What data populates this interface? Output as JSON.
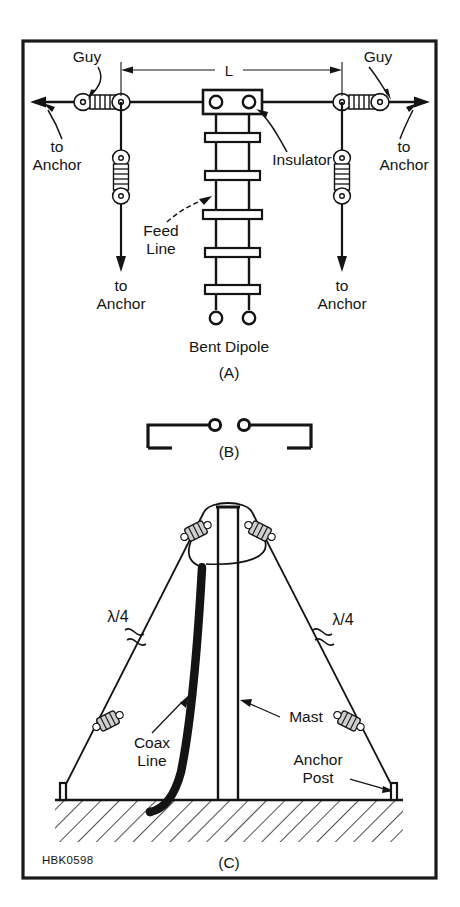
{
  "figure": {
    "id_code": "HBK0598",
    "panels": [
      {
        "key": "A",
        "caption": "Bent Dipole",
        "label": "(A)"
      },
      {
        "key": "B",
        "caption": "",
        "label": "(B)"
      },
      {
        "key": "C",
        "caption": "",
        "label": "(C)"
      }
    ],
    "panel_a": {
      "dimension_label": "L",
      "guy_left": "Guy",
      "guy_right": "Guy",
      "anchor_left_upper": {
        "line1": "to",
        "line2": "Anchor"
      },
      "anchor_left_lower": {
        "line1": "to",
        "line2": "Anchor"
      },
      "anchor_right_upper": {
        "line1": "to",
        "line2": "Anchor"
      },
      "anchor_right_lower": {
        "line1": "to",
        "line2": "Anchor"
      },
      "insulator_label": "Insulator",
      "feed_line": {
        "line1": "Feed",
        "line2": "Line"
      },
      "spreader_count": 5
    },
    "panel_c": {
      "quarter_wave_left": "λ/4",
      "quarter_wave_right": "λ/4",
      "mast_label": "Mast",
      "coax_label": {
        "line1": "Coax",
        "line2": "Line"
      },
      "anchor_post_label": {
        "line1": "Anchor",
        "line2": "Post"
      }
    },
    "colors": {
      "ink": "#141414",
      "paper": "#ffffff",
      "border": "#1a1a1a"
    }
  }
}
